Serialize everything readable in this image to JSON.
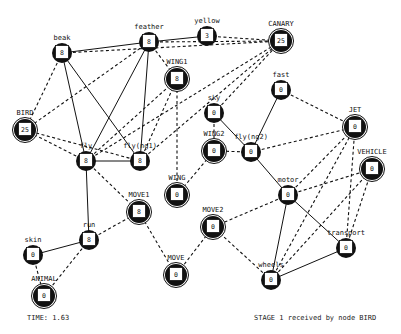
{
  "diagram": {
    "nodes": [
      {
        "id": "beak",
        "label": "beak",
        "value": "8",
        "x": 62,
        "y": 53,
        "type": "feature"
      },
      {
        "id": "feather",
        "label": "feather",
        "value": "8",
        "x": 149,
        "y": 42,
        "type": "feature"
      },
      {
        "id": "yellow",
        "label": "yellow",
        "value": "3",
        "x": 207,
        "y": 36,
        "type": "feature"
      },
      {
        "id": "CANARY",
        "label": "CANARY",
        "value": "25",
        "x": 281,
        "y": 41,
        "type": "concept"
      },
      {
        "id": "WING1",
        "label": "WING1",
        "value": "8",
        "x": 177,
        "y": 79,
        "type": "concept"
      },
      {
        "id": "BIRD",
        "label": "BIRD",
        "value": "25",
        "x": 25,
        "y": 130,
        "type": "concept"
      },
      {
        "id": "fly",
        "label": "fly",
        "value": "8",
        "x": 86,
        "y": 161,
        "type": "feature"
      },
      {
        "id": "fly1",
        "label": "fly(ng1)",
        "value": "8",
        "x": 140,
        "y": 161,
        "type": "feature"
      },
      {
        "id": "fast",
        "label": "fast",
        "value": "0",
        "x": 281,
        "y": 90,
        "type": "feature"
      },
      {
        "id": "sky",
        "label": "sky",
        "value": "0",
        "x": 214,
        "y": 113,
        "type": "feature"
      },
      {
        "id": "JET",
        "label": "JET",
        "value": "0",
        "x": 355,
        "y": 127,
        "type": "concept"
      },
      {
        "id": "WING2",
        "label": "WING2",
        "value": "0",
        "x": 214,
        "y": 151,
        "type": "concept"
      },
      {
        "id": "fly2",
        "label": "fly(ng2)",
        "value": "0",
        "x": 251,
        "y": 152,
        "type": "feature"
      },
      {
        "id": "VEHICLE",
        "label": "VEHICLE",
        "value": "0",
        "x": 372,
        "y": 169,
        "type": "concept"
      },
      {
        "id": "WING",
        "label": "WING",
        "value": "0",
        "x": 177,
        "y": 195,
        "type": "concept"
      },
      {
        "id": "motor",
        "label": "motor",
        "value": "0",
        "x": 288,
        "y": 195,
        "type": "feature"
      },
      {
        "id": "MOVE1",
        "label": "MOVE1",
        "value": "8",
        "x": 139,
        "y": 212,
        "type": "concept"
      },
      {
        "id": "run",
        "label": "run",
        "value": "8",
        "x": 89,
        "y": 240,
        "type": "feature"
      },
      {
        "id": "MOVE2",
        "label": "MOVE2",
        "value": "0",
        "x": 213,
        "y": 227,
        "type": "concept"
      },
      {
        "id": "transport",
        "label": "transport",
        "value": "0",
        "x": 346,
        "y": 248,
        "type": "feature"
      },
      {
        "id": "skin",
        "label": "skin",
        "value": "0",
        "x": 33,
        "y": 255,
        "type": "feature"
      },
      {
        "id": "MOVE",
        "label": "MOVE",
        "value": "0",
        "x": 176,
        "y": 275,
        "type": "concept"
      },
      {
        "id": "wheels",
        "label": "wheels",
        "value": "0",
        "x": 271,
        "y": 280,
        "type": "feature"
      },
      {
        "id": "ANIMAL",
        "label": "ANIMAL",
        "value": "0",
        "x": 44,
        "y": 296,
        "type": "concept"
      }
    ],
    "edges": [
      {
        "from": "beak",
        "to": "feather",
        "style": "solid"
      },
      {
        "from": "feather",
        "to": "yellow",
        "style": "solid"
      },
      {
        "from": "beak",
        "to": "fly",
        "style": "solid"
      },
      {
        "from": "beak",
        "to": "fly1",
        "style": "solid"
      },
      {
        "from": "feather",
        "to": "fly",
        "style": "solid"
      },
      {
        "from": "feather",
        "to": "fly1",
        "style": "solid"
      },
      {
        "from": "fly",
        "to": "fly1",
        "style": "solid"
      },
      {
        "from": "fly",
        "to": "run",
        "style": "solid"
      },
      {
        "from": "run",
        "to": "skin",
        "style": "solid"
      },
      {
        "from": "fast",
        "to": "fly2",
        "style": "solid"
      },
      {
        "from": "sky",
        "to": "fly2",
        "style": "solid"
      },
      {
        "from": "fly2",
        "to": "motor",
        "style": "solid"
      },
      {
        "from": "motor",
        "to": "transport",
        "style": "solid"
      },
      {
        "from": "motor",
        "to": "wheels",
        "style": "solid"
      },
      {
        "from": "wheels",
        "to": "transport",
        "style": "solid"
      },
      {
        "from": "beak",
        "to": "CANARY",
        "style": "dashed"
      },
      {
        "from": "feather",
        "to": "CANARY",
        "style": "dashed"
      },
      {
        "from": "yellow",
        "to": "CANARY",
        "style": "dashed"
      },
      {
        "from": "feather",
        "to": "WING1",
        "style": "dashed"
      },
      {
        "from": "fly",
        "to": "CANARY",
        "style": "dashed"
      },
      {
        "from": "fly1",
        "to": "CANARY",
        "style": "dashed"
      },
      {
        "from": "beak",
        "to": "BIRD",
        "style": "dashed"
      },
      {
        "from": "feather",
        "to": "BIRD",
        "style": "dashed"
      },
      {
        "from": "fly",
        "to": "BIRD",
        "style": "dashed"
      },
      {
        "from": "fly1",
        "to": "BIRD",
        "style": "dashed"
      },
      {
        "from": "fly",
        "to": "WING1",
        "style": "dashed"
      },
      {
        "from": "fly1",
        "to": "WING1",
        "style": "dashed"
      },
      {
        "from": "WING1",
        "to": "WING",
        "style": "dashed"
      },
      {
        "from": "WING2",
        "to": "WING",
        "style": "dashed"
      },
      {
        "from": "sky",
        "to": "WING2",
        "style": "dashed"
      },
      {
        "from": "fly2",
        "to": "WING2",
        "style": "dashed"
      },
      {
        "from": "fast",
        "to": "JET",
        "style": "dashed"
      },
      {
        "from": "fly2",
        "to": "JET",
        "style": "dashed"
      },
      {
        "from": "motor",
        "to": "JET",
        "style": "dashed"
      },
      {
        "from": "motor",
        "to": "VEHICLE",
        "style": "dashed"
      },
      {
        "from": "transport",
        "to": "JET",
        "style": "dashed"
      },
      {
        "from": "transport",
        "to": "VEHICLE",
        "style": "dashed"
      },
      {
        "from": "wheels",
        "to": "VEHICLE",
        "style": "dashed"
      },
      {
        "from": "wheels",
        "to": "JET",
        "style": "dashed"
      },
      {
        "from": "fly",
        "to": "MOVE1",
        "style": "dashed"
      },
      {
        "from": "run",
        "to": "MOVE1",
        "style": "dashed"
      },
      {
        "from": "MOVE1",
        "to": "MOVE",
        "style": "dashed"
      },
      {
        "from": "MOVE2",
        "to": "MOVE",
        "style": "dashed"
      },
      {
        "from": "motor",
        "to": "MOVE2",
        "style": "dashed"
      },
      {
        "from": "wheels",
        "to": "MOVE2",
        "style": "dashed"
      },
      {
        "from": "skin",
        "to": "ANIMAL",
        "style": "dashed"
      },
      {
        "from": "run",
        "to": "ANIMAL",
        "style": "dashed"
      },
      {
        "from": "sky",
        "to": "CANARY",
        "style": "dashed"
      }
    ]
  },
  "status": {
    "time_label": "TIME: 1.63",
    "stage_message": "STAGE 1 received by node BIRD"
  },
  "colors": {
    "background": "#ffffff",
    "ink": "#111111"
  }
}
